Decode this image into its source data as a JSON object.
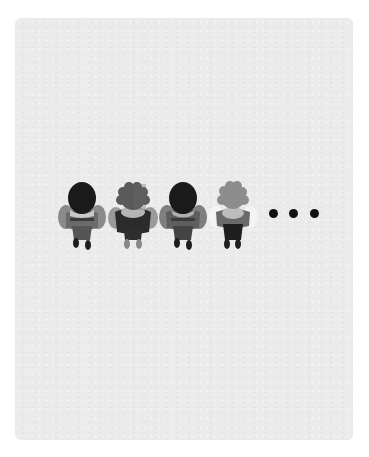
{
  "scene": {
    "description": "Top-down view of four people figures standing in a row followed by an ellipsis, printed on light gray paper",
    "paper_color": "#ebebeb",
    "background_color": "#ffffff"
  },
  "figures": [
    {
      "id": "person-1",
      "hair": "dark",
      "hair_color": "#1a1a1a",
      "shirt_color": "#6b6b6b",
      "arm_color": "#8a8a8a",
      "scarf_color": "#c9c9c9",
      "pants_color": "#333333"
    },
    {
      "id": "person-2",
      "hair": "curly",
      "hair_color": "#5a5a5a",
      "shirt_color": "#2b2b2b",
      "arm_color": "#9a9a9a",
      "scarf_color": "#b5b5b5",
      "pants_color": "#2e2e2e"
    },
    {
      "id": "person-3",
      "hair": "dark",
      "hair_color": "#1a1a1a",
      "shirt_color": "#5e5e5e",
      "arm_color": "#7f7f7f",
      "scarf_color": "#b0b0b0",
      "pants_color": "#333333"
    },
    {
      "id": "person-4",
      "hair": "curly",
      "hair_color": "#8d8d8d",
      "shirt_color": "#6a6a6a",
      "arm_color": "#f4f4f4",
      "scarf_color": "#bdbdbd",
      "pants_color": "#1f1f1f"
    }
  ],
  "ellipsis": {
    "count": 3,
    "color": "#111111"
  }
}
